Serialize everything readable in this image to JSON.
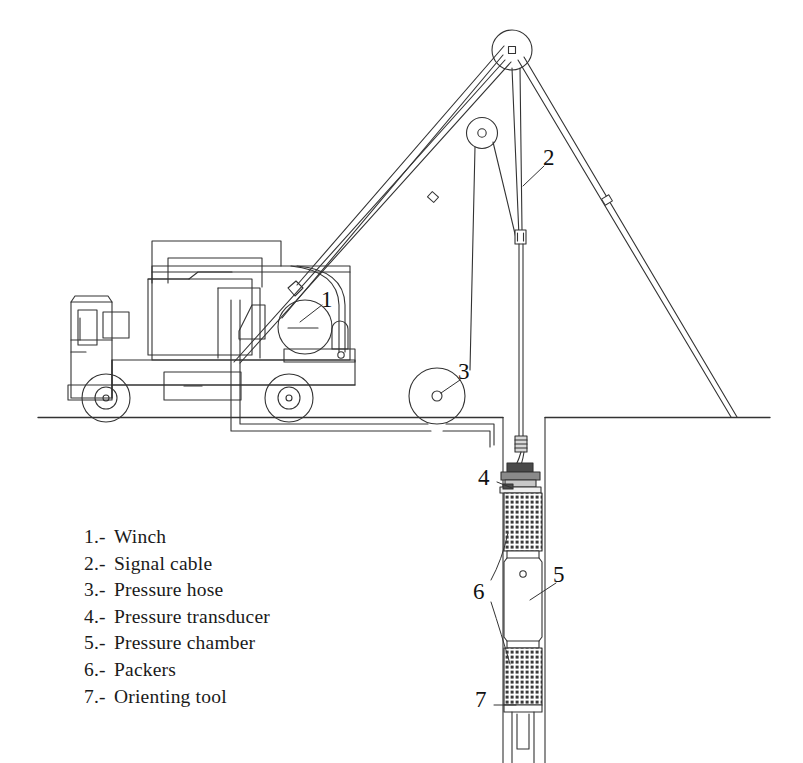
{
  "diagram": {
    "type": "technical-line-drawing",
    "background_color": "#ffffff",
    "line_color": "#333333",
    "ground_line_label": "ground surface"
  },
  "callouts": [
    {
      "id": "1",
      "label": "1",
      "x": 327,
      "y": 300,
      "target": "winch"
    },
    {
      "id": "2",
      "label": "2",
      "x": 549,
      "y": 158,
      "target": "signal-cable"
    },
    {
      "id": "3",
      "label": "3",
      "x": 464,
      "y": 372,
      "target": "pressure-hose"
    },
    {
      "id": "4",
      "label": "4",
      "x": 484,
      "y": 478,
      "target": "pressure-transducer"
    },
    {
      "id": "5",
      "label": "5",
      "x": 559,
      "y": 575,
      "target": "pressure-chamber"
    },
    {
      "id": "6",
      "label": "6",
      "x": 479,
      "y": 592,
      "target": "packers"
    },
    {
      "id": "7",
      "label": "7",
      "x": 481,
      "y": 700,
      "target": "orienting-tool"
    }
  ],
  "legend": {
    "items": [
      {
        "num": "1.-",
        "name": "Winch"
      },
      {
        "num": "2.-",
        "name": "Signal cable"
      },
      {
        "num": "3.-",
        "name": "Pressure hose"
      },
      {
        "num": "4.-",
        "name": "Pressure transducer"
      },
      {
        "num": "5.-",
        "name": "Pressure chamber"
      },
      {
        "num": "6.-",
        "name": "Packers"
      },
      {
        "num": "7.-",
        "name": "Orienting tool"
      }
    ]
  },
  "components": {
    "truck": "service truck with cabin, bed and equipment canopy",
    "tripod": "three-leg derrick mast with crown pulley",
    "crown_pulley": "top sheave at derrick apex",
    "secondary_pulley": "lower sheave on derrick leg",
    "hose_reel": "pressure hose reel at ground level",
    "borehole": "vertical borehole below ground line",
    "downhole_tool": "straddle packer assembly with transducer, chamber and orienting tool"
  }
}
